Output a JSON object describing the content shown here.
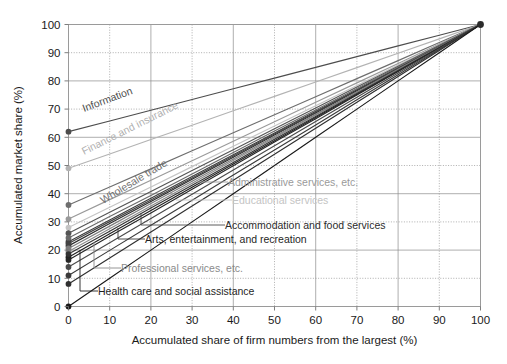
{
  "figure": {
    "background": "#ffffff",
    "frame_color": "#9a9a9a",
    "grid_color": "#8c8c8c"
  },
  "axes": {
    "x": {
      "label": "Accumulated share of firm numbers from the largest (%)",
      "ticks": [
        "0",
        "10",
        "20",
        "30",
        "40",
        "50",
        "60",
        "70",
        "80",
        "90",
        "100"
      ],
      "min": 0,
      "max": 100
    },
    "y": {
      "label": "Accumulated market share (%)",
      "ticks": [
        "0",
        "10",
        "20",
        "30",
        "40",
        "50",
        "60",
        "70",
        "80",
        "90",
        "100"
      ],
      "min": 0,
      "max": 100
    }
  },
  "chart_data": {
    "type": "line",
    "title": "",
    "xlabel": "Accumulated share of firm numbers from the largest (%)",
    "ylabel": "Accumulated market share (%)",
    "xlim": [
      0,
      100
    ],
    "ylim": [
      0,
      100
    ],
    "grid": true,
    "legend_position": "inline-labels",
    "note": "Lorenz-type concentration curves by industry; every series starts on the y-axis at x=0 and converges at (100,100).",
    "series": [
      {
        "name": "Information",
        "color": "#4d4d4d",
        "label_style": "rotated",
        "intercept": 62.0,
        "x": [
          0,
          10,
          20,
          30,
          40,
          50,
          60,
          70,
          80,
          90,
          100
        ],
        "values": [
          62.0,
          65.8,
          69.6,
          73.4,
          77.2,
          81.0,
          84.8,
          88.6,
          92.4,
          96.2,
          100.0
        ]
      },
      {
        "name": "Finance and insurance",
        "color": "#b3b3b3",
        "label_style": "rotated",
        "intercept": 49.0,
        "x": [
          0,
          10,
          20,
          30,
          40,
          50,
          60,
          70,
          80,
          90,
          100
        ],
        "values": [
          49.0,
          54.1,
          59.2,
          64.3,
          69.4,
          74.5,
          79.6,
          84.7,
          89.8,
          94.9,
          100.0
        ]
      },
      {
        "name": "Wholesale trade",
        "color": "#6e6e6e",
        "label_style": "rotated",
        "intercept": 36.0,
        "x": [
          0,
          10,
          20,
          30,
          40,
          50,
          60,
          70,
          80,
          90,
          100
        ],
        "values": [
          36.0,
          42.4,
          48.8,
          55.2,
          61.6,
          68.0,
          74.4,
          80.8,
          87.2,
          93.6,
          100.0
        ]
      },
      {
        "name": "Administrative services, etc.",
        "color": "#9a9a9a",
        "label_style": "leader",
        "intercept": 31.0,
        "x": [
          0,
          10,
          20,
          30,
          40,
          50,
          60,
          70,
          80,
          90,
          100
        ],
        "values": [
          31.0,
          37.9,
          44.8,
          51.7,
          58.6,
          65.5,
          72.4,
          79.3,
          86.2,
          93.1,
          100.0
        ]
      },
      {
        "name": "Educational services",
        "color": "#c4c4c4",
        "label_style": "leader",
        "intercept": 28.0,
        "x": [
          0,
          10,
          20,
          30,
          40,
          50,
          60,
          70,
          80,
          90,
          100
        ],
        "values": [
          28.0,
          35.2,
          42.4,
          49.6,
          56.8,
          64.0,
          71.2,
          78.4,
          85.6,
          92.8,
          100.0
        ]
      },
      {
        "name": "Accommodation and food services",
        "color": "#3d3d3d",
        "label_style": "leader",
        "intercept": 23.0,
        "x": [
          0,
          10,
          20,
          30,
          40,
          50,
          60,
          70,
          80,
          90,
          100
        ],
        "values": [
          23.0,
          30.7,
          38.4,
          46.1,
          53.8,
          61.5,
          69.2,
          76.9,
          84.6,
          92.3,
          100.0
        ]
      },
      {
        "name": "Arts, entertainment, and recreation",
        "color": "#2b2b2b",
        "label_style": "leader",
        "intercept": 21.5,
        "x": [
          0,
          10,
          20,
          30,
          40,
          50,
          60,
          70,
          80,
          90,
          100
        ],
        "values": [
          21.5,
          29.4,
          37.2,
          45.1,
          52.9,
          60.8,
          68.6,
          76.5,
          84.3,
          92.2,
          100.0
        ]
      },
      {
        "name": "Professional services, etc.",
        "color": "#8a8a8a",
        "label_style": "leader",
        "intercept": 19.5,
        "x": [
          0,
          10,
          20,
          30,
          40,
          50,
          60,
          70,
          80,
          90,
          100
        ],
        "values": [
          19.5,
          27.6,
          35.6,
          43.7,
          51.8,
          59.8,
          67.9,
          75.9,
          84.0,
          92.0,
          100.0
        ]
      },
      {
        "name": "Health care and social assistance",
        "color": "#1f1f1f",
        "label_style": "leader",
        "intercept": 17.5,
        "x": [
          0,
          10,
          20,
          30,
          40,
          50,
          60,
          70,
          80,
          90,
          100
        ],
        "values": [
          17.5,
          25.8,
          34.0,
          42.3,
          50.5,
          58.8,
          67.0,
          75.3,
          83.5,
          91.8,
          100.0
        ]
      },
      {
        "name": "unlabeled-series-1",
        "color": "#555555",
        "label_style": "none",
        "intercept": 26.0,
        "x": [
          0,
          10,
          20,
          30,
          40,
          50,
          60,
          70,
          80,
          90,
          100
        ],
        "values": [
          26.0,
          33.4,
          40.8,
          48.2,
          55.6,
          63.0,
          70.4,
          77.8,
          85.2,
          92.6,
          100.0
        ]
      },
      {
        "name": "unlabeled-series-2",
        "color": "#6a6a6a",
        "label_style": "none",
        "intercept": 24.3,
        "x": [
          0,
          10,
          20,
          30,
          40,
          50,
          60,
          70,
          80,
          90,
          100
        ],
        "values": [
          24.3,
          31.9,
          39.4,
          47.0,
          54.6,
          62.2,
          69.7,
          77.3,
          84.9,
          92.4,
          100.0
        ]
      },
      {
        "name": "unlabeled-series-3",
        "color": "#434343",
        "label_style": "none",
        "intercept": 22.3,
        "x": [
          0,
          10,
          20,
          30,
          40,
          50,
          60,
          70,
          80,
          90,
          100
        ],
        "values": [
          22.3,
          30.1,
          37.8,
          45.6,
          53.4,
          61.2,
          68.9,
          76.7,
          84.5,
          92.2,
          100.0
        ]
      },
      {
        "name": "unlabeled-series-4",
        "color": "#7d7d7d",
        "label_style": "none",
        "intercept": 20.6,
        "x": [
          0,
          10,
          20,
          30,
          40,
          50,
          60,
          70,
          80,
          90,
          100
        ],
        "values": [
          20.6,
          28.5,
          36.5,
          44.4,
          52.3,
          60.3,
          68.2,
          76.1,
          84.1,
          92.0,
          100.0
        ]
      },
      {
        "name": "unlabeled-series-5",
        "color": "#333333",
        "label_style": "none",
        "intercept": 18.6,
        "x": [
          0,
          10,
          20,
          30,
          40,
          50,
          60,
          70,
          80,
          90,
          100
        ],
        "values": [
          18.6,
          26.7,
          34.9,
          43.0,
          51.1,
          59.3,
          67.4,
          75.5,
          83.7,
          91.8,
          100.0
        ]
      },
      {
        "name": "unlabeled-series-6",
        "color": "#262626",
        "label_style": "none",
        "intercept": 16.5,
        "x": [
          0,
          10,
          20,
          30,
          40,
          50,
          60,
          70,
          80,
          90,
          100
        ],
        "values": [
          16.5,
          24.9,
          33.2,
          41.6,
          49.9,
          58.3,
          66.6,
          75.0,
          83.3,
          91.7,
          100.0
        ]
      },
      {
        "name": "unlabeled-series-7",
        "color": "#4a4a4a",
        "label_style": "none",
        "intercept": 14.0,
        "x": [
          0,
          10,
          20,
          30,
          40,
          50,
          60,
          70,
          80,
          90,
          100
        ],
        "values": [
          14.0,
          22.6,
          31.2,
          39.8,
          48.4,
          57.0,
          65.6,
          74.2,
          82.8,
          91.4,
          100.0
        ]
      },
      {
        "name": "unlabeled-series-8",
        "color": "#3a3a3a",
        "label_style": "none",
        "intercept": 11.0,
        "x": [
          0,
          10,
          20,
          30,
          40,
          50,
          60,
          70,
          80,
          90,
          100
        ],
        "values": [
          11.0,
          19.9,
          28.8,
          37.7,
          46.6,
          55.5,
          64.4,
          73.3,
          82.2,
          91.1,
          100.0
        ]
      },
      {
        "name": "unlabeled-series-9",
        "color": "#2f2f2f",
        "label_style": "none",
        "intercept": 8.0,
        "x": [
          0,
          10,
          20,
          30,
          40,
          50,
          60,
          70,
          80,
          90,
          100
        ],
        "values": [
          8.0,
          17.2,
          26.4,
          35.6,
          44.8,
          54.0,
          63.2,
          72.4,
          81.6,
          90.8,
          100.0
        ]
      },
      {
        "name": "unlabeled-series-10",
        "color": "#1a1a1a",
        "label_style": "none",
        "intercept": 0.0,
        "x": [
          0,
          10,
          20,
          30,
          40,
          50,
          60,
          70,
          80,
          90,
          100
        ],
        "values": [
          0.0,
          10.0,
          20.0,
          30.0,
          40.0,
          50.0,
          60.0,
          70.0,
          80.0,
          90.0,
          100.0
        ]
      }
    ],
    "convergence_point": [
      100,
      100
    ]
  },
  "labels": {
    "information": "Information",
    "finance": "Finance and insurance",
    "wholesale": "Wholesale trade",
    "administrative": "Administrative services, etc.",
    "educational": "Educational services",
    "accommodation": "Accommodation and food services",
    "arts": "Arts, entertainment, and recreation",
    "professional": "Professional services, etc.",
    "health": "Health care and social assistance"
  }
}
